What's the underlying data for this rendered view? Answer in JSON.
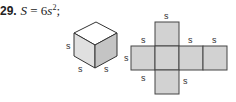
{
  "problem": {
    "number": "29.",
    "equation_var": "S",
    "equation_eq": " = 6",
    "equation_s": "s",
    "equation_exp": "2",
    "equation_tail": ";"
  },
  "cube": {
    "labels": [
      "s",
      "s",
      "s"
    ],
    "colors": {
      "top": "#ffffff",
      "left": "#e0e0e0",
      "right": "#c4c4c4",
      "stroke": "#333333"
    }
  },
  "net": {
    "labels": [
      "s",
      "s",
      "s",
      "s",
      "s",
      "s",
      "s"
    ],
    "fill": "#d2d2d2",
    "stroke": "#444444"
  }
}
